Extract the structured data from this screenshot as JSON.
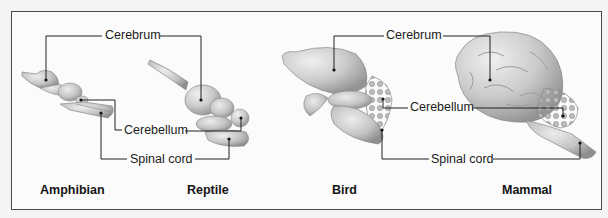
{
  "diagram": {
    "structures": {
      "cerebrum": "Cerebrum",
      "cerebellum": "Cerebellum",
      "spinal_cord": "Spinal cord"
    },
    "animals": [
      {
        "name": "Amphibian"
      },
      {
        "name": "Reptile"
      },
      {
        "name": "Bird"
      },
      {
        "name": "Mammal"
      }
    ],
    "colors": {
      "frame": "#4a4a4a",
      "leader_line": "#222222",
      "brain_fill": "#c9c9c9",
      "brain_shade": "#9a9a9a",
      "background": "#fbfbfb"
    }
  }
}
